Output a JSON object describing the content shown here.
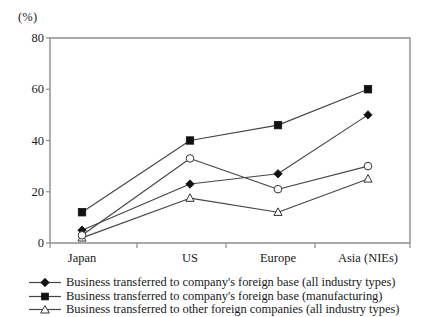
{
  "chart_data": {
    "type": "line",
    "title": "",
    "subtitle": "",
    "xlabel": "",
    "ylabel": "",
    "unit_label": "(%)",
    "categories": [
      "Japan",
      "US",
      "Europe",
      "Asia (NIEs)"
    ],
    "ylim": [
      0,
      80
    ],
    "yticks": [
      0,
      20,
      40,
      60,
      80
    ],
    "ytick_labels": [
      "0",
      "20",
      "40",
      "60",
      "80"
    ],
    "grid": false,
    "legend_position": "bottom",
    "series": [
      {
        "name": "Business transferred to company's foreign base (all industry types)",
        "marker": "filled-diamond",
        "values": [
          5,
          23,
          27,
          50
        ]
      },
      {
        "name": "Business transferred to company's foreign base (manufacturing)",
        "marker": "filled-square",
        "values": [
          12,
          40,
          46,
          60
        ]
      },
      {
        "name": "Business transferred to other foreign companies (all industry types)",
        "marker": "open-triangle",
        "values": [
          2,
          17.5,
          12,
          25
        ]
      },
      {
        "name": "",
        "marker": "open-circle",
        "values": [
          3,
          33,
          21,
          30
        ]
      }
    ]
  },
  "axis": {
    "unit_label": "(%)",
    "ytick_labels": [
      "80",
      "60",
      "40",
      "20",
      "0"
    ],
    "xtick_labels": [
      "Japan",
      "US",
      "Europe",
      "Asia (NIEs)"
    ]
  },
  "legend": {
    "items": [
      {
        "marker": "filled-diamond",
        "label": "Business transferred to company's foreign base (all industry types)"
      },
      {
        "marker": "filled-square",
        "label": "Business transferred to company's foreign base (manufacturing)"
      },
      {
        "marker": "open-triangle",
        "label": "Business transferred to other foreign companies (all industry types)"
      }
    ]
  },
  "colors": {
    "line": "#444444",
    "marker_fill": "#111111",
    "marker_open": "#ffffff",
    "axis": "#8d8d8d",
    "text": "#1a1a1a"
  }
}
